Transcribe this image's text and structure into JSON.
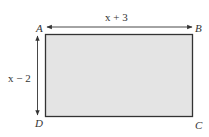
{
  "diagram": {
    "shape": "rectangle",
    "vertices": {
      "top_left": "A",
      "top_right": "B",
      "bottom_right": "C",
      "bottom_left": "D"
    },
    "dimensions": {
      "width_label": "x + 3",
      "height_label": "x − 2"
    },
    "fill_color": "#e4e4e4",
    "stroke_color": "#333333"
  }
}
